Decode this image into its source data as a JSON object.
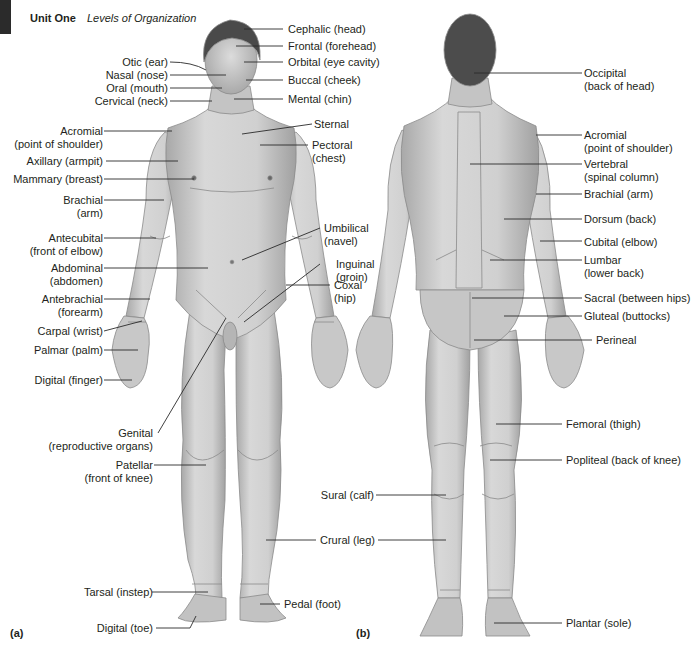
{
  "header": {
    "unit": "Unit One",
    "subtitle": "Levels of Organization"
  },
  "panels": {
    "a": "(a)",
    "b": "(b)"
  },
  "colors": {
    "skin": "#d4d4d4",
    "skin_shadow": "#a9a9a9",
    "hair": "#4a4a4a",
    "outline": "#7a7a7a",
    "leader": "#2a2a2a",
    "text": "#231f20"
  },
  "anterior": {
    "left_labels": [
      {
        "l1": "Otic (ear)"
      },
      {
        "l1": "Nasal (nose)"
      },
      {
        "l1": "Oral (mouth)"
      },
      {
        "l1": "Cervical (neck)"
      },
      {
        "l1": "Acromial",
        "l2": "(point of shoulder)"
      },
      {
        "l1": "Axillary (armpit)"
      },
      {
        "l1": "Mammary (breast)"
      },
      {
        "l1": "Brachial",
        "l2": "(arm)"
      },
      {
        "l1": "Antecubital",
        "l2": "(front of elbow)"
      },
      {
        "l1": "Abdominal",
        "l2": "(abdomen)"
      },
      {
        "l1": "Antebrachial",
        "l2": "(forearm)"
      },
      {
        "l1": "Carpal (wrist)"
      },
      {
        "l1": "Palmar (palm)"
      },
      {
        "l1": "Digital (finger)"
      },
      {
        "l1": "Genital",
        "l2": "(reproductive organs)"
      },
      {
        "l1": "Patellar",
        "l2": "(front of knee)"
      },
      {
        "l1": "Tarsal (instep)"
      },
      {
        "l1": "Digital (toe)"
      }
    ],
    "right_labels": [
      {
        "l1": "Cephalic (head)"
      },
      {
        "l1": "Frontal (forehead)"
      },
      {
        "l1": "Orbital (eye cavity)"
      },
      {
        "l1": "Buccal (cheek)"
      },
      {
        "l1": "Mental (chin)"
      },
      {
        "l1": "Sternal"
      },
      {
        "l1": "Pectoral",
        "l2": "(chest)"
      },
      {
        "l1": "Umbilical",
        "l2": "(navel)"
      },
      {
        "l1": "Inguinal",
        "l2": "(groin)"
      },
      {
        "l1": "Coxal",
        "l2": "(hip)"
      },
      {
        "l1": "Crural (leg)"
      },
      {
        "l1": "Pedal (foot)"
      }
    ]
  },
  "posterior": {
    "left_labels": [
      {
        "l1": "Sural (calf)"
      }
    ],
    "right_labels": [
      {
        "l1": "Occipital",
        "l2": "(back of head)"
      },
      {
        "l1": "Acromial",
        "l2": "(point of shoulder)"
      },
      {
        "l1": "Vertebral",
        "l2": "(spinal column)"
      },
      {
        "l1": "Brachial (arm)"
      },
      {
        "l1": "Dorsum (back)"
      },
      {
        "l1": "Cubital (elbow)"
      },
      {
        "l1": "Lumbar",
        "l2": "(lower back)"
      },
      {
        "l1": "Sacral (between hips)"
      },
      {
        "l1": "Gluteal (buttocks)"
      },
      {
        "l1": "Perineal"
      },
      {
        "l1": "Femoral (thigh)"
      },
      {
        "l1": "Popliteal (back of knee)"
      },
      {
        "l1": "Plantar (sole)"
      }
    ]
  }
}
